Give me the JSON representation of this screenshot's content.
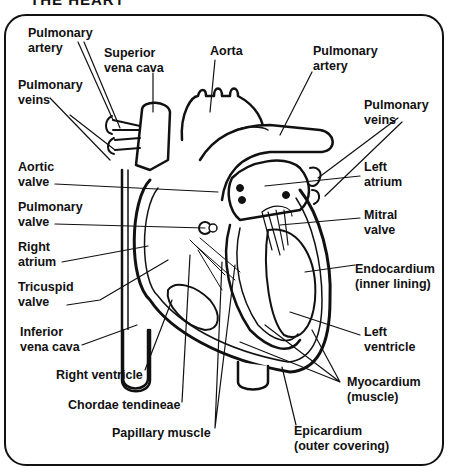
{
  "title": "THE HEART",
  "labels": {
    "pulmonary_artery_left": "Pulmonary\nartery",
    "superior_vena_cava": "Superior\nvena cava",
    "aorta": "Aorta",
    "pulmonary_artery_right": "Pulmonary\nartery",
    "pulmonary_veins_left": "Pulmonary\nveins",
    "pulmonary_veins_right": "Pulmonary\nveins",
    "aortic_valve": "Aortic\nvalve",
    "left_atrium": "Left\natrium",
    "pulmonary_valve": "Pulmonary\nvalve",
    "mitral_valve": "Mitral\nvalve",
    "right_atrium": "Right\natrium",
    "endocardium": "Endocardium\n(inner lining)",
    "tricuspid_valve": "Tricuspid\nvalve",
    "inferior_vena_cava": "Inferior\nvena cava",
    "left_ventricle": "Left\nventricle",
    "right_ventricle": "Right ventricle",
    "myocardium": "Myocardium\n(muscle)",
    "chordae_tendineae": "Chordae tendineae",
    "papillary_muscle": "Papillary muscle",
    "epicardium": "Epicardium\n(outer covering)"
  }
}
